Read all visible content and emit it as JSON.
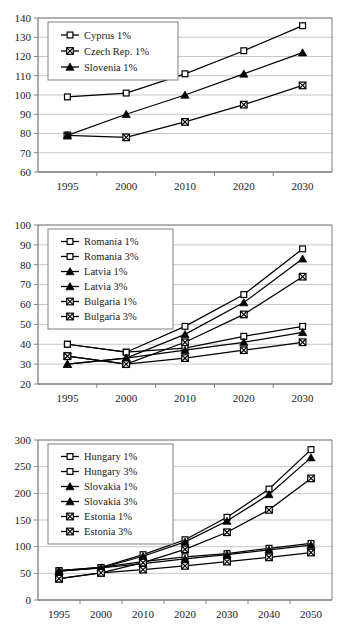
{
  "document": {
    "kind": "scanned-figure-page",
    "background_color": "#ffffff",
    "line_color": "#000000",
    "axis_color": "#808080",
    "gridline_color": "#b0b0b0"
  },
  "chart_data": [
    {
      "id": "chart-1",
      "type": "line",
      "title": "",
      "xlabel": "",
      "ylabel": "",
      "x": [
        "1995",
        "2000",
        "2010",
        "2020",
        "2030"
      ],
      "ylim": [
        60,
        140
      ],
      "ytick_step": 10,
      "yticks": [
        60,
        70,
        80,
        90,
        100,
        110,
        120,
        130,
        140
      ],
      "grid": true,
      "legend_position": "upper-left-inside",
      "series": [
        {
          "name": "Cyprus 1%",
          "marker": "open-square",
          "values": [
            99,
            101,
            111,
            123,
            136
          ]
        },
        {
          "name": "Czech Rep. 1%",
          "marker": "crossed-square",
          "values": [
            79,
            78,
            86,
            95,
            105
          ]
        },
        {
          "name": "Slovenia 1%",
          "marker": "filled-triangle",
          "values": [
            79,
            90,
            100,
            111,
            122
          ]
        }
      ]
    },
    {
      "id": "chart-2",
      "type": "line",
      "title": "",
      "xlabel": "",
      "ylabel": "",
      "x": [
        "1995",
        "2000",
        "2010",
        "2020",
        "2030"
      ],
      "ylim": [
        20,
        100
      ],
      "ytick_step": 10,
      "yticks": [
        20,
        30,
        40,
        50,
        60,
        70,
        80,
        90,
        100
      ],
      "grid": true,
      "legend_position": "upper-left-inside",
      "series": [
        {
          "name": "Romania 1%",
          "marker": "open-square",
          "values": [
            40,
            36,
            38,
            44,
            49
          ]
        },
        {
          "name": "Romania 3%",
          "marker": "open-square",
          "values": [
            40,
            36,
            49,
            65,
            88
          ]
        },
        {
          "name": "Latvia 1%",
          "marker": "filled-triangle",
          "values": [
            30,
            33,
            37,
            41,
            46
          ]
        },
        {
          "name": "Latvia 3%",
          "marker": "filled-triangle",
          "values": [
            30,
            33,
            45,
            61,
            83
          ]
        },
        {
          "name": "Bulgaria 1%",
          "marker": "crossed-square",
          "values": [
            34,
            30,
            33,
            37,
            41
          ]
        },
        {
          "name": "Bulgaria 3%",
          "marker": "crossed-square",
          "values": [
            34,
            30,
            41,
            55,
            74
          ]
        }
      ]
    },
    {
      "id": "chart-3",
      "type": "line",
      "title": "",
      "xlabel": "",
      "ylabel": "",
      "x": [
        "1995",
        "2000",
        "2010",
        "2020",
        "2030",
        "2040",
        "2050"
      ],
      "ylim": [
        0,
        300
      ],
      "ytick_step": 50,
      "yticks": [
        0,
        50,
        100,
        150,
        200,
        250,
        300
      ],
      "grid": true,
      "legend_position": "upper-left-inside",
      "series": [
        {
          "name": "Hungary 1%",
          "marker": "open-square",
          "values": [
            55,
            61,
            72,
            81,
            87,
            97,
            106
          ]
        },
        {
          "name": "Hungary 3%",
          "marker": "open-square",
          "values": [
            55,
            61,
            85,
            113,
            155,
            208,
            282
          ]
        },
        {
          "name": "Slovakia 1%",
          "marker": "filled-triangle",
          "values": [
            54,
            60,
            68,
            77,
            85,
            94,
            103
          ]
        },
        {
          "name": "Slovakia 3%",
          "marker": "filled-triangle",
          "values": [
            54,
            60,
            82,
            109,
            148,
            198,
            267
          ]
        },
        {
          "name": "Estonia 1%",
          "marker": "crossed-square",
          "values": [
            40,
            51,
            57,
            64,
            72,
            80,
            89
          ]
        },
        {
          "name": "Estonia 3%",
          "marker": "crossed-square",
          "values": [
            40,
            51,
            70,
            95,
            127,
            169,
            228
          ]
        }
      ]
    }
  ]
}
